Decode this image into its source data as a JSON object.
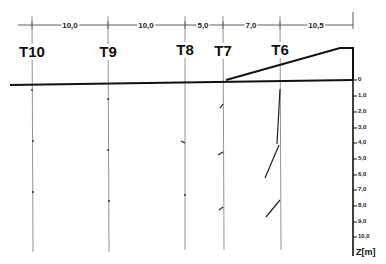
{
  "diagram": {
    "dimensions": [
      {
        "label": "10,0",
        "x": 70
      },
      {
        "label": "10,0",
        "x": 146
      },
      {
        "label": "5,0",
        "x": 203
      },
      {
        "label": "7,0",
        "x": 251
      },
      {
        "label": "10,5",
        "x": 316
      }
    ],
    "tubes": [
      {
        "label": "T10",
        "x": 32
      },
      {
        "label": "T9",
        "x": 108
      },
      {
        "label": "T8",
        "x": 185
      },
      {
        "label": "T7",
        "x": 223
      },
      {
        "label": "T6",
        "x": 280
      }
    ],
    "depth_axis": {
      "title": "Z[m]",
      "ticks": [
        "0",
        "1,0",
        "2,0",
        "3,0",
        "4,0",
        "5,0",
        "6,0",
        "7,0",
        "8,0",
        "9,0",
        "10,0"
      ]
    }
  }
}
